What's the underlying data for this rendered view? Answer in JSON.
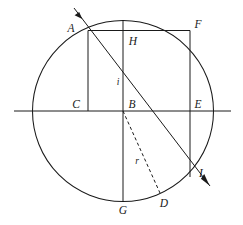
{
  "figure": {
    "background_color": "#ffffff",
    "stroke_color": "#1a1a1a",
    "width": 243,
    "height": 225
  },
  "geometry": {
    "circle": {
      "center": {
        "x": 123,
        "y": 111
      },
      "radius": 90.5,
      "label": "circle"
    },
    "horizontal_axis": {
      "x1": 14,
      "y1": 111,
      "x2": 231,
      "y2": 111
    },
    "vertical_diameter": {
      "x1": 123,
      "y1": 20.5,
      "x2": 123,
      "y2": 201.5
    },
    "ray": {
      "start": {
        "x": 74,
        "y": 8
      },
      "end": {
        "x": 210,
        "y": 186
      },
      "arrow_start": true,
      "arrow_end": true
    },
    "chord_AF": {
      "x1": 88,
      "y1": 30.5,
      "x2": 190,
      "y2": 30.5
    },
    "segment_AC": {
      "x1": 88,
      "y1": 30.5,
      "x2": 88,
      "y2": 111
    },
    "segment_FI": {
      "x1": 190,
      "y1": 30.5,
      "x2": 190,
      "y2": 177
    },
    "dashed_radius": {
      "x1": 123,
      "y1": 111,
      "x2": 160,
      "y2": 193
    }
  },
  "labels": {
    "points": [
      {
        "id": "A",
        "text": "A",
        "x": 71,
        "y": 32,
        "anchor": "middle"
      },
      {
        "id": "H",
        "text": "H",
        "x": 133,
        "y": 45,
        "anchor": "middle"
      },
      {
        "id": "F",
        "text": "F",
        "x": 198,
        "y": 28,
        "anchor": "middle"
      },
      {
        "id": "C",
        "text": "C",
        "x": 76,
        "y": 108,
        "anchor": "middle"
      },
      {
        "id": "B",
        "text": "B",
        "x": 132,
        "y": 108,
        "anchor": "middle"
      },
      {
        "id": "E",
        "text": "E",
        "x": 198,
        "y": 108,
        "anchor": "middle"
      },
      {
        "id": "I",
        "text": "I",
        "x": 201,
        "y": 177,
        "anchor": "middle"
      },
      {
        "id": "D",
        "text": "D",
        "x": 164,
        "y": 207,
        "anchor": "middle"
      },
      {
        "id": "G",
        "text": "G",
        "x": 123,
        "y": 214,
        "anchor": "middle"
      }
    ],
    "variables": [
      {
        "id": "i",
        "text": "i",
        "x": 118,
        "y": 85,
        "anchor": "middle"
      },
      {
        "id": "r",
        "text": "r",
        "x": 137,
        "y": 164,
        "anchor": "middle"
      }
    ]
  }
}
